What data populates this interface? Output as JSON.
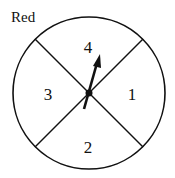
{
  "diagram": {
    "title": "Red",
    "type": "spinner",
    "sections": [
      {
        "label": "4",
        "position": "top"
      },
      {
        "label": "1",
        "position": "right"
      },
      {
        "label": "2",
        "position": "bottom"
      },
      {
        "label": "3",
        "position": "left"
      }
    ],
    "pointer": {
      "points_to": "4"
    },
    "colors": {
      "stroke": "#111111",
      "background": "#ffffff"
    }
  }
}
